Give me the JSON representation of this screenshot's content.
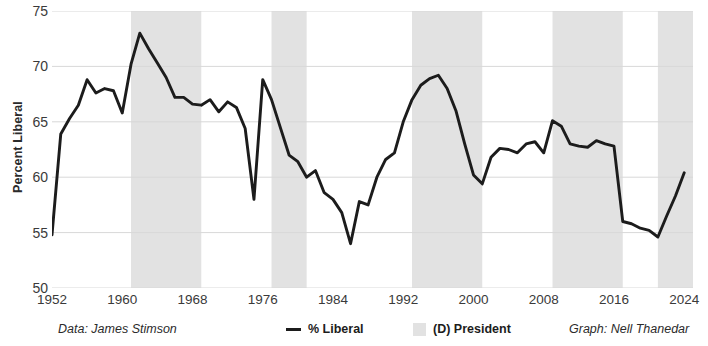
{
  "chart_data": {
    "type": "line",
    "title": "",
    "xlabel": "",
    "ylabel": "Percent Liberal",
    "xlim": [
      1952,
      2025
    ],
    "ylim": [
      50,
      75
    ],
    "yticks": [
      50,
      55,
      60,
      65,
      70,
      75
    ],
    "xticks": [
      1952,
      1960,
      1968,
      1976,
      1984,
      1992,
      2000,
      2008,
      2016,
      2024
    ],
    "grid": "horizontal",
    "legend_position": "below-axis",
    "line_color": "#1c1c1c",
    "band_color": "#e2e2e2",
    "series": [
      {
        "name": "% Liberal",
        "x": [
          1952,
          1953,
          1954,
          1955,
          1956,
          1957,
          1958,
          1959,
          1960,
          1961,
          1962,
          1963,
          1964,
          1965,
          1966,
          1967,
          1968,
          1969,
          1970,
          1971,
          1972,
          1973,
          1974,
          1975,
          1976,
          1977,
          1978,
          1979,
          1980,
          1981,
          1982,
          1983,
          1984,
          1985,
          1986,
          1987,
          1988,
          1989,
          1990,
          1991,
          1992,
          1993,
          1994,
          1995,
          1996,
          1997,
          1998,
          1999,
          2000,
          2001,
          2002,
          2003,
          2004,
          2005,
          2006,
          2007,
          2008,
          2009,
          2010,
          2011,
          2012,
          2013,
          2014,
          2015,
          2016,
          2017,
          2018,
          2019,
          2020,
          2021,
          2022,
          2023,
          2024
        ],
        "values": [
          54.8,
          63.9,
          65.3,
          66.5,
          68.8,
          67.6,
          68.0,
          67.8,
          65.8,
          70.2,
          73.0,
          71.6,
          70.3,
          69.0,
          67.2,
          67.2,
          66.6,
          66.5,
          67.0,
          65.9,
          66.8,
          66.3,
          64.4,
          58.0,
          68.8,
          67.0,
          64.5,
          62.0,
          61.4,
          60.0,
          60.6,
          58.6,
          58.0,
          56.8,
          54.0,
          57.8,
          57.5,
          60.0,
          61.6,
          62.2,
          65.0,
          67.0,
          68.3,
          68.9,
          69.2,
          68.0,
          66.0,
          63.0,
          60.2,
          59.4,
          61.8,
          62.6,
          62.5,
          62.2,
          63.0,
          63.2,
          62.2,
          65.1,
          64.6,
          63.0,
          62.8,
          62.7,
          63.3,
          63.0,
          62.8,
          56.0,
          55.8,
          55.4,
          55.2,
          54.6,
          56.5,
          58.3,
          60.4
        ]
      }
    ],
    "bands": [
      {
        "label": "(D) President",
        "start": 1961,
        "end": 1969
      },
      {
        "label": "(D) President",
        "start": 1977,
        "end": 1981
      },
      {
        "label": "(D) President",
        "start": 1993,
        "end": 2001
      },
      {
        "label": "(D) President",
        "start": 2009,
        "end": 2017
      },
      {
        "label": "(D) President",
        "start": 2021,
        "end": 2025
      }
    ]
  },
  "footer": {
    "data_credit": "Data: James Stimson",
    "legend_line_label": "% Liberal",
    "legend_band_label": "(D) President",
    "graph_credit": "Graph: Nell Thanedar"
  }
}
